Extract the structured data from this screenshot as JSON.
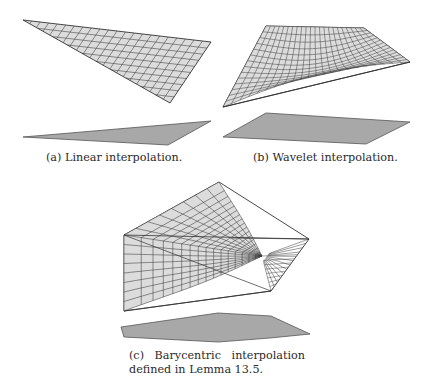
{
  "figure": {
    "panels": [
      {
        "id": "a",
        "label": "(a)",
        "caption": "Linear interpolation.",
        "caption_full": "(a) Linear interpolation.",
        "surface": {
          "type": "linear",
          "vertices": [
            [
              23,
              20
            ],
            [
              211,
              42
            ],
            [
              170,
              103
            ]
          ]
        },
        "base_polygon": [
          [
            23,
            137
          ],
          [
            211,
            121
          ],
          [
            168,
            145
          ]
        ]
      },
      {
        "id": "b",
        "label": "(b)",
        "caption": "Wavelet interpolation.",
        "caption_full": "(b) Wavelet interpolation.",
        "surface": {
          "type": "wavelet",
          "vertices": [
            [
              266,
              26
            ],
            [
              364,
              28
            ],
            [
              410,
              62
            ],
            [
              223,
              107
            ]
          ]
        },
        "base_polygon": [
          [
            266,
            113
          ],
          [
            410,
            122
          ],
          [
            366,
            144
          ],
          [
            223,
            137
          ]
        ]
      },
      {
        "id": "c",
        "label": "(c)",
        "caption_line1": [
          "(c)",
          "Barycentric",
          "interpolation"
        ],
        "caption_line2": "defined in Lemma 13.5.",
        "caption_full": "(c) Barycentric interpolation defined in Lemma 13.5.",
        "surface": {
          "type": "barycentric",
          "vertices": [
            [
              219,
              182
            ],
            [
              309,
              239
            ],
            [
              271,
              291
            ],
            [
              124,
              311
            ],
            [
              124,
              235
            ]
          ]
        },
        "base_polygon": [
          [
            121,
            327
          ],
          [
            218,
            313
          ],
          [
            271,
            316
          ],
          [
            310,
            334
          ],
          [
            270,
            338
          ],
          [
            218,
            342
          ],
          [
            124,
            337
          ]
        ]
      }
    ],
    "colors": {
      "mesh_fill": "#dcdcdc",
      "mesh_line": "#3a3a3a",
      "base_fill": "#a8a8a8",
      "base_stroke": "#555555",
      "edge": "#333333"
    }
  }
}
